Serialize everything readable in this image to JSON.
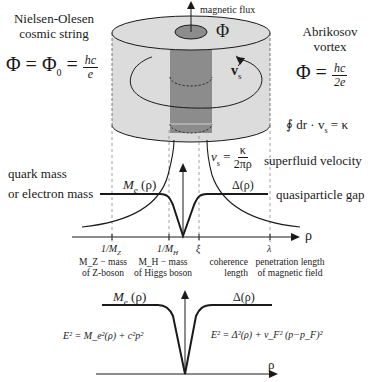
{
  "top_left": {
    "title_line1": "Nielsen-Olesen",
    "title_line2": "cosmic string",
    "formula_lhs": "Φ = Φ",
    "formula_sub": "0",
    "formula_eq": " = ",
    "frac_num": "hc",
    "frac_den": "e"
  },
  "top_right": {
    "title_line1": "Abrikosov",
    "title_line2": "vortex",
    "formula_lhs": "Φ = ",
    "frac_num": "hc",
    "frac_den": "2e",
    "circulation": "∮ dr · v",
    "circulation_sub": "s",
    "circulation_rhs": " = κ"
  },
  "cylinder": {
    "flux_label": "magnetic flux",
    "flux_symbol": "Φ",
    "velocity_label": "v",
    "velocity_sub": "s"
  },
  "upper_plot": {
    "left_label_line1": "quark mass",
    "left_label_line2": "or electron mass",
    "me_label": "M",
    "me_sub": "e",
    "me_arg": " (ρ)",
    "delta_label": "Δ(ρ)",
    "right_label": "quasiparticle gap",
    "vs_lhs": "v",
    "vs_sub": "s",
    "vs_eq": " = ",
    "vs_num": "κ",
    "vs_den": "2πρ",
    "vs_caption": "superfluid velocity",
    "axis_label": "ρ",
    "ticks": [
      {
        "label": "1/M",
        "sub": "Z",
        "desc_line1": "M_Z − mass",
        "desc_line2": "of Z-boson"
      },
      {
        "label": "1/M",
        "sub": "H",
        "desc_line1": "M_H − mass",
        "desc_line2": "of Higgs boson"
      },
      {
        "label": "ξ",
        "sub": "",
        "desc_line1": "coherence",
        "desc_line2": "length"
      },
      {
        "label": "λ",
        "sub": "",
        "desc_line1": "penetration length",
        "desc_line2": "of magnetic field"
      }
    ]
  },
  "lower_plot": {
    "me_label": "M",
    "me_sub": "e",
    "me_arg": " (ρ)",
    "delta_label": "Δ(ρ)",
    "axis_label": "ρ",
    "left_formula": "E² = M_e²(ρ) + c²p²",
    "right_formula": "E² = Δ²(ρ) + v_F² (p−p_F)²"
  },
  "colors": {
    "cylinder_fill": "#dcdcdc",
    "core_fill": "#8c8c8c",
    "ink": "#1a1a1a"
  }
}
